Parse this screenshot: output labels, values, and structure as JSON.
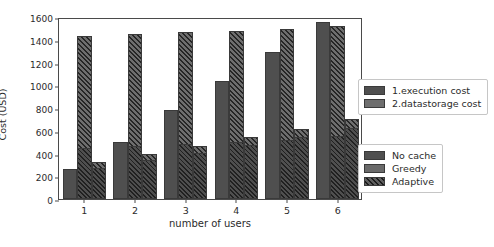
{
  "chart_data": {
    "type": "bar",
    "title": "",
    "xlabel": "number of users",
    "ylabel": "Cost (USD)",
    "categories": [
      "1",
      "2",
      "3",
      "4",
      "5",
      "6"
    ],
    "ylim": [
      0,
      1600
    ],
    "yticks": [
      0,
      200,
      400,
      600,
      800,
      1000,
      1200,
      1400,
      1600
    ],
    "grid": false,
    "bar_group_order": [
      "No cache",
      "Greedy",
      "Adaptive"
    ],
    "stack_order": [
      "1.execution cost",
      "2.datastorage cost"
    ],
    "series": [
      {
        "name": "No cache",
        "hatch": false,
        "values": [
          265,
          505,
          780,
          1035,
          1290,
          1555
        ],
        "execution_cost": [
          265,
          505,
          780,
          1035,
          1290,
          1555
        ],
        "datastorage_cost": [
          0,
          0,
          0,
          0,
          0,
          0
        ]
      },
      {
        "name": "Greedy",
        "hatch": true,
        "values": [
          1435,
          1450,
          1470,
          1475,
          1495,
          1520
        ],
        "execution_cost": [
          440,
          455,
          470,
          490,
          505,
          540
        ],
        "datastorage_cost": [
          995,
          995,
          1000,
          985,
          990,
          980
        ]
      },
      {
        "name": "Adaptive",
        "hatch": true,
        "values": [
          325,
          400,
          470,
          545,
          615,
          700
        ],
        "execution_cost": [
          270,
          340,
          405,
          470,
          540,
          620
        ],
        "datastorage_cost": [
          55,
          60,
          65,
          75,
          75,
          80
        ]
      }
    ],
    "legends": [
      {
        "name": "cost-type-legend",
        "position": "right-upper",
        "entries": [
          {
            "label": "1.execution cost",
            "color": "#4f4f4f",
            "swatch": "exec"
          },
          {
            "label": "2.datastorage cost",
            "color": "#6e6e6e",
            "swatch": "store"
          }
        ]
      },
      {
        "name": "policy-legend",
        "position": "right-lower",
        "entries": [
          {
            "label": "No cache",
            "color": "#4f4f4f",
            "swatch": "nocache"
          },
          {
            "label": "Greedy",
            "color": "#6a6a6a",
            "swatch": "greedy"
          },
          {
            "label": "Adaptive",
            "color": "#5f5f5f",
            "swatch": "adaptive"
          }
        ]
      }
    ],
    "colors": {
      "execution_cost": "#4f4f4f",
      "datastorage_cost": "#6e6e6e",
      "axis": "#4a4a4a",
      "background": "#ffffff",
      "text": "#2b2b2b"
    }
  }
}
